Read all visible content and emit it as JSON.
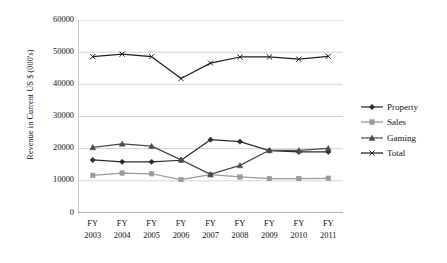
{
  "chart_data": {
    "type": "line",
    "title": "",
    "xlabel": "",
    "ylabel": "Revenue in Current US $ (000's)",
    "categories": [
      "FY 2003",
      "FY 2004",
      "FY 2005",
      "FY 2006",
      "FY 2007",
      "FY 2008",
      "FY 2009",
      "FY 2010",
      "FY 2011"
    ],
    "category_lines": [
      {
        "word": "FY",
        "year": "2003"
      },
      {
        "word": "FY",
        "year": "2004"
      },
      {
        "word": "FY",
        "year": "2005"
      },
      {
        "word": "FY",
        "year": "2006"
      },
      {
        "word": "FY",
        "year": "2007"
      },
      {
        "word": "FY",
        "year": "2008"
      },
      {
        "word": "FY",
        "year": "2009"
      },
      {
        "word": "FY",
        "year": "2010"
      },
      {
        "word": "FY",
        "year": "2011"
      }
    ],
    "ylim": [
      0,
      60000
    ],
    "yticks": [
      0,
      10000,
      20000,
      30000,
      40000,
      50000,
      60000
    ],
    "ytick_labels": [
      "0",
      "10000",
      "20000",
      "30000",
      "40000",
      "50000",
      "60000"
    ],
    "grid": "horizontal",
    "legend_position": "right",
    "series": [
      {
        "name": "Property",
        "marker": "diamond",
        "color": "#2b2b2b",
        "values": [
          16500,
          15900,
          15900,
          16400,
          22800,
          22200,
          19400,
          19000,
          19000
        ]
      },
      {
        "name": "Sales",
        "marker": "square",
        "color": "#9a9a9a",
        "values": [
          11700,
          12400,
          12200,
          10400,
          11900,
          11200,
          10700,
          10700,
          10800
        ]
      },
      {
        "name": "Gaming",
        "marker": "triangle",
        "color": "#4a4a4a",
        "values": [
          20400,
          21500,
          20800,
          16500,
          12000,
          14800,
          19500,
          19500,
          20100
        ]
      },
      {
        "name": "Total",
        "marker": "x",
        "color": "#1f1f1f",
        "values": [
          48600,
          49400,
          48600,
          41800,
          46600,
          48500,
          48500,
          47800,
          48700
        ]
      }
    ]
  },
  "legend": {
    "items": [
      {
        "label": "Property"
      },
      {
        "label": "Sales"
      },
      {
        "label": "Gaming"
      },
      {
        "label": "Total"
      }
    ]
  }
}
